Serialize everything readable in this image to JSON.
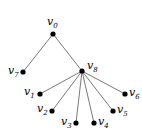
{
  "diagram": {
    "type": "tree",
    "colors": {
      "edge": "#555555",
      "node": "#000000",
      "label": "#000000",
      "background": "#ffffff"
    },
    "nodes": [
      {
        "id": "v0",
        "base": "v",
        "sub": "0",
        "x": 53,
        "y": 34,
        "label_x": 47,
        "label_y": 25,
        "anchor": "start"
      },
      {
        "id": "v7",
        "base": "v",
        "sub": "7",
        "x": 23,
        "y": 72,
        "label_x": 8,
        "label_y": 74,
        "anchor": "start"
      },
      {
        "id": "v8",
        "base": "v",
        "sub": "8",
        "x": 82,
        "y": 71,
        "label_x": 87,
        "label_y": 69,
        "anchor": "start"
      },
      {
        "id": "v1",
        "base": "v",
        "sub": "1",
        "x": 40,
        "y": 94,
        "label_x": 24,
        "label_y": 95,
        "anchor": "start"
      },
      {
        "id": "v2",
        "base": "v",
        "sub": "2",
        "x": 52,
        "y": 111,
        "label_x": 37,
        "label_y": 112,
        "anchor": "start"
      },
      {
        "id": "v3",
        "base": "v",
        "sub": "3",
        "x": 76,
        "y": 123,
        "label_x": 61,
        "label_y": 125,
        "anchor": "start"
      },
      {
        "id": "v4",
        "base": "v",
        "sub": "4",
        "x": 94,
        "y": 123,
        "label_x": 98,
        "label_y": 125,
        "anchor": "start"
      },
      {
        "id": "v5",
        "base": "v",
        "sub": "5",
        "x": 113,
        "y": 111,
        "label_x": 117,
        "label_y": 113,
        "anchor": "start"
      },
      {
        "id": "v6",
        "base": "v",
        "sub": "6",
        "x": 125,
        "y": 94,
        "label_x": 129,
        "label_y": 96,
        "anchor": "start"
      }
    ],
    "edges": [
      {
        "from": "v0",
        "to": "v7"
      },
      {
        "from": "v0",
        "to": "v8"
      },
      {
        "from": "v8",
        "to": "v1"
      },
      {
        "from": "v8",
        "to": "v2"
      },
      {
        "from": "v8",
        "to": "v3"
      },
      {
        "from": "v8",
        "to": "v4"
      },
      {
        "from": "v8",
        "to": "v5"
      },
      {
        "from": "v8",
        "to": "v6"
      }
    ]
  }
}
